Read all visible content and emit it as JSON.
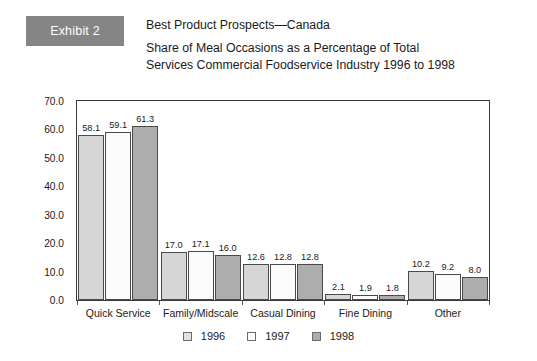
{
  "header": {
    "badge_label": "Exhibit 2",
    "title_lines": [
      "Best Product Prospects—Canada",
      "Share of Meal Occasions as a Percentage of Total",
      "Services Commercial Foodservice Industry 1996 to 1998"
    ]
  },
  "colors": {
    "badge_bg": "#858585",
    "series_1996": "#d6d6d6",
    "series_1997": "#fbfbfb",
    "series_1998": "#adadad",
    "axis": "#3a3a3a",
    "text": "#1a1a1a"
  },
  "chart_data": {
    "type": "bar",
    "title": "Share of Meal Occasions as a Percentage of Total Services Commercial Foodservice Industry 1996 to 1998",
    "xlabel": "",
    "ylabel": "",
    "ylim": [
      0,
      70
    ],
    "ytick_step": 10,
    "ytick_labels": [
      "0.0",
      "10.0",
      "20.0",
      "30.0",
      "40.0",
      "50.0",
      "60.0",
      "70.0"
    ],
    "grid": false,
    "legend_position": "bottom-center",
    "categories": [
      "Quick Service",
      "Family/Midscale",
      "Casual Dining",
      "Fine Dining",
      "Other"
    ],
    "series": [
      {
        "name": "1996",
        "values": [
          58.1,
          17.0,
          12.6,
          2.1,
          10.2
        ]
      },
      {
        "name": "1997",
        "values": [
          59.1,
          17.1,
          12.8,
          1.9,
          9.2
        ]
      },
      {
        "name": "1998",
        "values": [
          61.3,
          16.0,
          12.8,
          1.8,
          8.0
        ]
      }
    ],
    "data_labels": [
      [
        "58.1",
        "59.1",
        "61.3"
      ],
      [
        "17.0",
        "17.1",
        "16.0"
      ],
      [
        "12.6",
        "12.8",
        "12.8"
      ],
      [
        "2.1",
        "1.9",
        "1.8"
      ],
      [
        "10.2",
        "9.2",
        "8.0"
      ]
    ]
  },
  "legend": {
    "items": [
      {
        "label": "1996"
      },
      {
        "label": "1997"
      },
      {
        "label": "1998"
      }
    ]
  }
}
